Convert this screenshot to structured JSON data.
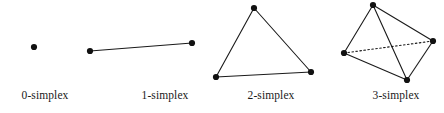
{
  "figure": {
    "width": 444,
    "height": 113,
    "background_color": "#ffffff",
    "stroke_color": "#1a1a1a",
    "vertex_color": "#111111",
    "edge_width": 1.1,
    "hidden_edge_style": "dotted",
    "vertex_radius": 3.1
  },
  "panels": [
    {
      "id": "panel-0-simplex",
      "label": "0-simplex",
      "label_x": 45,
      "label_y": 100,
      "dimension": 0,
      "vertices": [
        {
          "name": "v0",
          "x": 34,
          "y": 47
        }
      ],
      "edges": [],
      "hidden_edges": []
    },
    {
      "id": "panel-1-simplex",
      "label": "1-simplex",
      "label_x": 165,
      "label_y": 100,
      "dimension": 1,
      "vertices": [
        {
          "name": "v0",
          "x": 90,
          "y": 51
        },
        {
          "name": "v1",
          "x": 192,
          "y": 43
        }
      ],
      "edges": [
        {
          "from": "v0",
          "to": "v1"
        }
      ],
      "hidden_edges": []
    },
    {
      "id": "panel-2-simplex",
      "label": "2-simplex",
      "label_x": 271,
      "label_y": 100,
      "dimension": 2,
      "vertices": [
        {
          "name": "v0",
          "x": 254,
          "y": 8
        },
        {
          "name": "v1",
          "x": 216,
          "y": 77
        },
        {
          "name": "v2",
          "x": 311,
          "y": 72
        }
      ],
      "edges": [
        {
          "from": "v0",
          "to": "v1"
        },
        {
          "from": "v1",
          "to": "v2"
        },
        {
          "from": "v2",
          "to": "v0"
        }
      ],
      "hidden_edges": []
    },
    {
      "id": "panel-3-simplex",
      "label": "3-simplex",
      "label_x": 396,
      "label_y": 100,
      "dimension": 3,
      "vertices": [
        {
          "name": "v0",
          "x": 373,
          "y": 5
        },
        {
          "name": "v1",
          "x": 344,
          "y": 53
        },
        {
          "name": "v2",
          "x": 433,
          "y": 41
        },
        {
          "name": "v3",
          "x": 407,
          "y": 80
        }
      ],
      "edges": [
        {
          "from": "v0",
          "to": "v1"
        },
        {
          "from": "v0",
          "to": "v2"
        },
        {
          "from": "v0",
          "to": "v3"
        },
        {
          "from": "v1",
          "to": "v3"
        },
        {
          "from": "v2",
          "to": "v3"
        }
      ],
      "hidden_edges": [
        {
          "from": "v1",
          "to": "v2"
        }
      ]
    }
  ]
}
